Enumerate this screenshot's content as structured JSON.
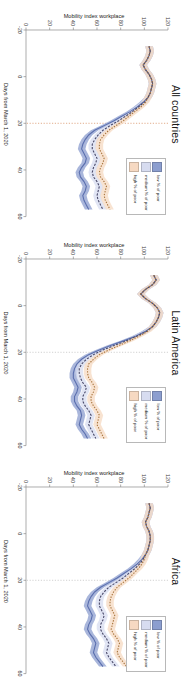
{
  "figure": {
    "panels": [
      {
        "title": "All countries"
      },
      {
        "title": "Latin America"
      },
      {
        "title": "Africa"
      }
    ],
    "legend": {
      "items": [
        {
          "label": "low % of poor",
          "color": "#8c9ecf"
        },
        {
          "label": "medium % of poor",
          "color": "#d7dcf0"
        },
        {
          "label": "high % of poor",
          "color": "#f6d9c2"
        }
      ]
    },
    "axis": {
      "x_title": "Days from March 1, 2020",
      "y_title": "Mobility index workplace",
      "x_ticks": [
        "-20",
        "0",
        "20",
        "40",
        "60"
      ],
      "y_ticks": [
        "0",
        "20",
        "40",
        "60",
        "80",
        "100",
        "120"
      ]
    },
    "reference_line_note": "20"
  },
  "chart_data": [
    {
      "type": "line",
      "title": "All countries",
      "xlabel": "Days from March 1, 2020",
      "ylabel": "Mobility index workplace",
      "xlim": [
        -20,
        60
      ],
      "ylim": [
        0,
        120
      ],
      "grid": false,
      "legend_position": "top-right",
      "reference_line_x": 20,
      "reference_line_style": "dotted",
      "reference_line_color": "#d58a5a",
      "x": [
        -13,
        -11,
        -9,
        -7,
        -5,
        -3,
        -1,
        1,
        3,
        5,
        7,
        9,
        11,
        13,
        15,
        17,
        19,
        21,
        23,
        25,
        27,
        29,
        31,
        33,
        35,
        37,
        39,
        41,
        43,
        45,
        47,
        49,
        51,
        53,
        55,
        57
      ],
      "series": [
        {
          "name": "low % of poor",
          "color": "#5b6fae",
          "band_color": "#8c9ecf",
          "values": [
            104,
            105,
            104,
            102,
            99,
            101,
            104,
            106,
            107,
            106,
            105,
            103,
            99,
            94,
            88,
            81,
            74,
            66,
            58,
            53,
            50,
            48,
            47,
            49,
            51,
            50,
            47,
            45,
            46,
            49,
            51,
            50,
            48,
            49,
            51,
            53
          ]
        },
        {
          "name": "medium % of poor",
          "color": "#4a4a6a",
          "band_color": "#d7dcf0",
          "values": [
            104,
            105,
            104,
            102,
            99,
            101,
            104,
            106,
            107,
            106,
            105,
            103,
            100,
            95,
            90,
            84,
            78,
            71,
            65,
            61,
            58,
            56,
            56,
            58,
            60,
            59,
            57,
            56,
            57,
            60,
            62,
            61,
            60,
            61,
            63,
            65
          ]
        },
        {
          "name": "high % of poor",
          "color": "#a9763f",
          "band_color": "#f6d9c2",
          "values": [
            104,
            105,
            104,
            102,
            99,
            101,
            104,
            106,
            107,
            106,
            105,
            103,
            101,
            97,
            92,
            87,
            82,
            76,
            70,
            66,
            63,
            62,
            62,
            64,
            66,
            65,
            63,
            62,
            63,
            66,
            68,
            67,
            66,
            67,
            69,
            71
          ]
        }
      ]
    },
    {
      "type": "line",
      "title": "Latin America",
      "xlabel": "Days from March 1, 2020",
      "ylabel": "Mobility index workplace",
      "xlim": [
        -20,
        60
      ],
      "ylim": [
        0,
        120
      ],
      "grid": false,
      "legend_position": "top-right",
      "reference_line_x": 20,
      "reference_line_style": "dotted",
      "reference_line_color": "#bdbdbd",
      "x": [
        -13,
        -11,
        -9,
        -7,
        -5,
        -3,
        -1,
        1,
        3,
        5,
        7,
        9,
        11,
        13,
        15,
        17,
        19,
        21,
        23,
        25,
        27,
        29,
        31,
        33,
        35,
        37,
        39,
        41,
        43,
        45,
        47,
        49,
        51,
        53,
        55,
        57
      ],
      "series": [
        {
          "name": "low % of poor",
          "color": "#5b6fae",
          "band_color": "#8c9ecf",
          "values": [
            108,
            110,
            107,
            101,
            97,
            101,
            107,
            111,
            113,
            112,
            110,
            107,
            101,
            93,
            83,
            72,
            62,
            53,
            47,
            43,
            41,
            40,
            40,
            42,
            44,
            43,
            41,
            41,
            43,
            46,
            47,
            46,
            45,
            47,
            50,
            52
          ]
        },
        {
          "name": "medium % of poor",
          "color": "#4a4a6a",
          "band_color": "#d7dcf0",
          "values": [
            108,
            110,
            107,
            101,
            97,
            101,
            107,
            111,
            113,
            112,
            110,
            107,
            102,
            94,
            85,
            75,
            65,
            57,
            51,
            47,
            45,
            45,
            46,
            48,
            51,
            50,
            48,
            48,
            50,
            53,
            55,
            54,
            53,
            55,
            57,
            59
          ]
        },
        {
          "name": "high % of poor",
          "color": "#a9763f",
          "band_color": "#f6d9c2",
          "values": [
            108,
            110,
            107,
            101,
            97,
            101,
            107,
            111,
            113,
            112,
            110,
            107,
            103,
            96,
            88,
            79,
            70,
            62,
            57,
            53,
            52,
            52,
            53,
            56,
            58,
            57,
            55,
            55,
            57,
            60,
            62,
            61,
            60,
            62,
            64,
            66
          ]
        }
      ]
    },
    {
      "type": "line",
      "title": "Africa",
      "xlabel": "Days from March 1, 2020",
      "ylabel": "Mobility index workplace",
      "xlim": [
        -20,
        60
      ],
      "ylim": [
        0,
        120
      ],
      "grid": false,
      "legend_position": "top-right",
      "reference_line_x": 20,
      "reference_line_style": "dotted",
      "reference_line_color": "#bdbdbd",
      "x": [
        -13,
        -11,
        -9,
        -7,
        -5,
        -3,
        -1,
        1,
        3,
        5,
        7,
        9,
        11,
        13,
        15,
        17,
        19,
        21,
        23,
        25,
        27,
        29,
        31,
        33,
        35,
        37,
        39,
        41,
        43,
        45,
        47,
        49,
        51,
        53,
        55,
        57
      ],
      "series": [
        {
          "name": "low % of poor",
          "color": "#5b6fae",
          "band_color": "#8c9ecf",
          "values": [
            104,
            105,
            104,
            103,
            101,
            102,
            104,
            105,
            105,
            104,
            103,
            101,
            98,
            94,
            89,
            83,
            77,
            70,
            63,
            58,
            55,
            53,
            52,
            54,
            56,
            55,
            53,
            52,
            54,
            57,
            59,
            58,
            57,
            59,
            62,
            65
          ]
        },
        {
          "name": "medium % of poor",
          "color": "#4a4a6a",
          "band_color": "#d7dcf0",
          "values": [
            104,
            105,
            104,
            103,
            101,
            102,
            104,
            105,
            105,
            104,
            103,
            101,
            99,
            96,
            92,
            87,
            82,
            76,
            70,
            66,
            63,
            62,
            62,
            64,
            66,
            65,
            63,
            63,
            65,
            68,
            70,
            69,
            68,
            70,
            73,
            76
          ]
        },
        {
          "name": "high % of poor",
          "color": "#a9763f",
          "band_color": "#f6d9c2",
          "values": [
            104,
            105,
            104,
            103,
            101,
            102,
            104,
            105,
            105,
            104,
            103,
            101,
            100,
            98,
            95,
            91,
            87,
            82,
            77,
            74,
            72,
            71,
            71,
            73,
            75,
            74,
            73,
            72,
            74,
            77,
            79,
            78,
            77,
            79,
            82,
            85
          ]
        }
      ]
    }
  ]
}
